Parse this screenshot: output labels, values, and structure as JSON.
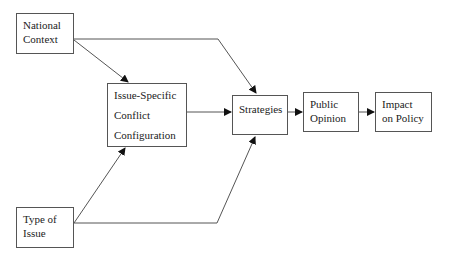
{
  "diagram": {
    "nodes": {
      "national_context": {
        "lines": [
          "National",
          "Context"
        ]
      },
      "issue_specific": {
        "lines": [
          "Issue-Specific",
          "Conflict",
          "Configuration"
        ]
      },
      "type_of_issue": {
        "lines": [
          "Type of",
          "Issue"
        ]
      },
      "strategies": {
        "lines": [
          "Strategies"
        ]
      },
      "public_opinion": {
        "lines": [
          "Public",
          "Opinion"
        ]
      },
      "impact_on_policy": {
        "lines": [
          "Impact",
          "on Policy"
        ]
      }
    },
    "edges": [
      {
        "from": "National Context",
        "to": "Issue-Specific Conflict Configuration"
      },
      {
        "from": "National Context",
        "to": "Strategies"
      },
      {
        "from": "Type of Issue",
        "to": "Issue-Specific Conflict Configuration"
      },
      {
        "from": "Type of Issue",
        "to": "Strategies"
      },
      {
        "from": "Issue-Specific Conflict Configuration",
        "to": "Strategies"
      },
      {
        "from": "Strategies",
        "to": "Public Opinion"
      },
      {
        "from": "Public Opinion",
        "to": "Impact on Policy"
      }
    ],
    "colors": {
      "line": "#444444",
      "border": "#555555"
    }
  }
}
